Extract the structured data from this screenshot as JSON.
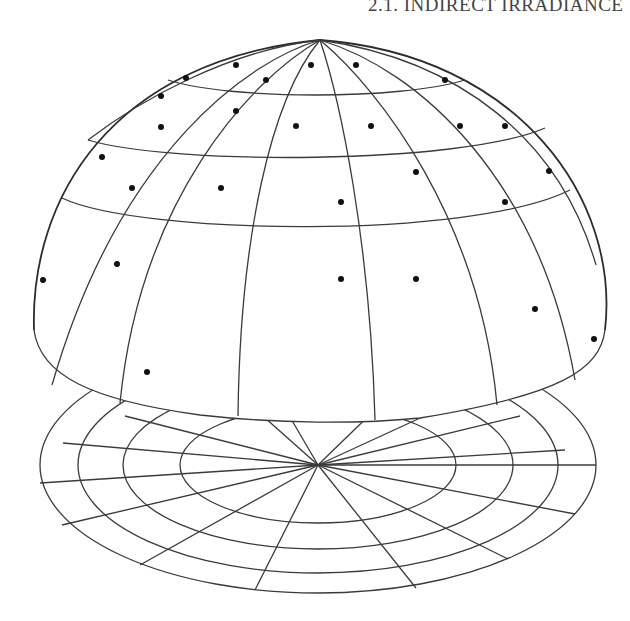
{
  "header": {
    "running_title": "2.1. INDIRECT IRRADIANCE"
  },
  "figure": {
    "hemisphere": {
      "latitude_bands": 4,
      "longitude_lines": 16,
      "sample_count": 31
    },
    "disc": {
      "rings": 4,
      "spokes": 16
    },
    "colors": {
      "line": "#3a3a3a",
      "dot": "#111111",
      "background": "#ffffff"
    }
  }
}
